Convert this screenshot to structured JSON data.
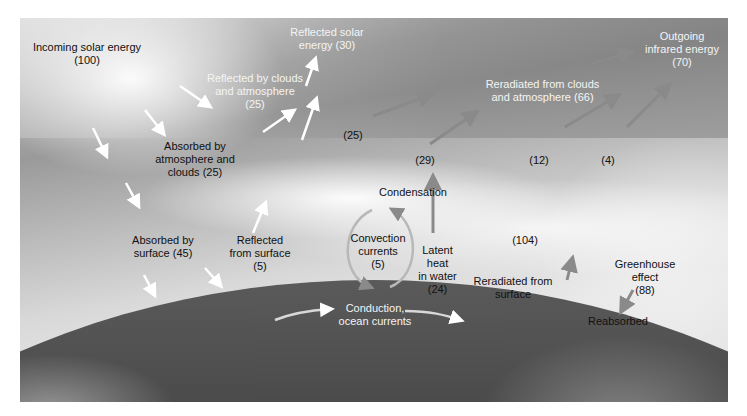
{
  "diagram": {
    "labels": {
      "incoming": {
        "line1": "Incoming solar energy",
        "line2": "(100)"
      },
      "reflected_solar": {
        "line1": "Reflected solar",
        "line2": "energy (30)"
      },
      "reflected_clouds": {
        "line1": "Reflected by clouds",
        "line2": "and atmosphere",
        "line3": "(25)"
      },
      "absorbed_atmo": {
        "line1": "Absorbed by",
        "line2": "atmosphere and",
        "line3": "clouds (25)"
      },
      "absorbed_surface": {
        "line1": "Absorbed by",
        "line2": "surface (45)"
      },
      "reflected_surface": {
        "line1": "Reflected",
        "line2": "from surface",
        "line3": "(5)"
      },
      "outgoing_ir": {
        "line1": "Outgoing",
        "line2": "infrared energy",
        "line3": "(70)"
      },
      "reradiated_clouds": {
        "line1": "Reradiated from clouds",
        "line2": "and atmosphere (66)"
      },
      "val_25": "(25)",
      "val_29": "(29)",
      "val_12": "(12)",
      "val_4": "(4)",
      "condensation": "Condensation",
      "convection": {
        "line1": "Convection",
        "line2": "currents",
        "line3": "(5)"
      },
      "latent": {
        "line1": "Latent",
        "line2": "heat",
        "line3": "in water",
        "line4": "(24)"
      },
      "val_104": "(104)",
      "reradiated_surface": {
        "line1": "Reradiated from",
        "line2": "surface"
      },
      "greenhouse": {
        "line1": "Greenhouse",
        "line2": "effect",
        "line3": "(88)"
      },
      "reabsorbed": "Reabsorbed",
      "conduction": {
        "line1": "Conduction,",
        "line2": "ocean currents"
      }
    },
    "colors": {
      "shortwave_arrow": "#ffffff",
      "longwave_arrow": "#8a8a8a",
      "background": "#c8c8c8",
      "earth": "#3e3e3e"
    }
  }
}
